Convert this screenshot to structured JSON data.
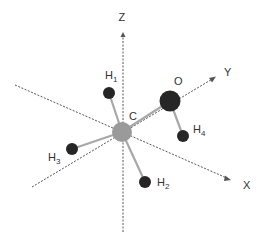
{
  "figure": {
    "colors": {
      "background": "#ffffff",
      "axis": "#555555",
      "bond": "#a8a8a8",
      "carbon": "#9a9a9a",
      "oxygen": "#262626",
      "hydrogen": "#262626",
      "label": "#333333"
    },
    "axes": [
      {
        "id": "Z",
        "label": "Z"
      },
      {
        "id": "Y",
        "label": "Y"
      },
      {
        "id": "X",
        "label": "X"
      }
    ],
    "atoms": [
      {
        "id": "C",
        "element": "C",
        "label": "C",
        "sub": ""
      },
      {
        "id": "O",
        "element": "O",
        "label": "O",
        "sub": ""
      },
      {
        "id": "H1",
        "element": "H",
        "label": "H",
        "sub": "1"
      },
      {
        "id": "H2",
        "element": "H",
        "label": "H",
        "sub": "2"
      },
      {
        "id": "H3",
        "element": "H",
        "label": "H",
        "sub": "3"
      },
      {
        "id": "H4",
        "element": "H",
        "label": "H",
        "sub": "4"
      }
    ],
    "bonds": [
      {
        "from": "C",
        "to": "O"
      },
      {
        "from": "C",
        "to": "H1"
      },
      {
        "from": "C",
        "to": "H2"
      },
      {
        "from": "C",
        "to": "H3"
      },
      {
        "from": "O",
        "to": "H4"
      }
    ]
  }
}
